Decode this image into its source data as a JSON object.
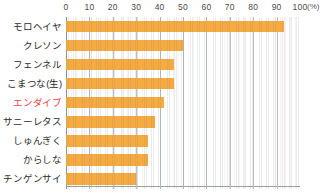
{
  "chart_data": {
    "type": "bar",
    "orientation": "horizontal",
    "title": "",
    "subtitle": "",
    "xlabel": "",
    "ylabel": "",
    "unit_label": "(%)",
    "xlim": [
      0,
      100
    ],
    "xticks": [
      0,
      10,
      20,
      30,
      40,
      50,
      60,
      70,
      80,
      90,
      100
    ],
    "xtick_labels": [
      "0",
      "10",
      "20",
      "30",
      "40",
      "50",
      "60",
      "70",
      "80",
      "90",
      "100"
    ],
    "grid": true,
    "legend": false,
    "legend_position": "none",
    "categories": [
      "モロヘイヤ",
      "クレソン",
      "フェンネル",
      "こまつな(生)",
      "エンダイブ",
      "サニーレタス",
      "しゅんぎく",
      "からしな",
      "チンゲンサイ"
    ],
    "values": [
      93,
      50,
      46,
      46,
      42,
      38,
      35,
      35,
      30
    ],
    "highlighted_category": "エンダイブ",
    "highlight_color": "#e8443c",
    "bar_color": "#f7ab3e",
    "axis_color": "#8c9296",
    "gridline_color": "#b9bfc4",
    "label_color": "#2b2b2b"
  }
}
